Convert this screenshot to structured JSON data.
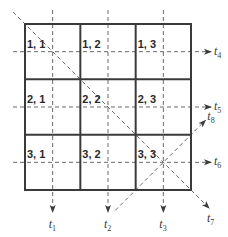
{
  "diagram": {
    "title": "",
    "grid": {
      "rows": 3,
      "cols": 3
    },
    "cells": [
      {
        "row": 1,
        "col": 1,
        "label": "1, 1"
      },
      {
        "row": 1,
        "col": 2,
        "label": "1, 2"
      },
      {
        "row": 1,
        "col": 3,
        "label": "1, 3"
      },
      {
        "row": 2,
        "col": 1,
        "label": "2, 1"
      },
      {
        "row": 2,
        "col": 2,
        "label": "2, 2"
      },
      {
        "row": 2,
        "col": 3,
        "label": "2, 3"
      },
      {
        "row": 3,
        "col": 1,
        "label": "3, 1"
      },
      {
        "row": 3,
        "col": 2,
        "label": "3, 2"
      },
      {
        "row": 3,
        "col": 3,
        "label": "3, 3"
      }
    ],
    "directions": [
      {
        "id": "t1",
        "base": "t",
        "sub": "1",
        "kind": "vertical",
        "index": 1
      },
      {
        "id": "t2",
        "base": "t",
        "sub": "2",
        "kind": "vertical",
        "index": 2
      },
      {
        "id": "t3",
        "base": "t",
        "sub": "3",
        "kind": "vertical",
        "index": 3
      },
      {
        "id": "t4",
        "base": "t",
        "sub": "4",
        "kind": "horizontal",
        "index": 1
      },
      {
        "id": "t5",
        "base": "t",
        "sub": "5",
        "kind": "horizontal",
        "index": 2
      },
      {
        "id": "t6",
        "base": "t",
        "sub": "6",
        "kind": "horizontal",
        "index": 3
      },
      {
        "id": "t7",
        "base": "t",
        "sub": "7",
        "kind": "diagonal-main"
      },
      {
        "id": "t8",
        "base": "t",
        "sub": "8",
        "kind": "diagonal-anti"
      }
    ],
    "colors": {
      "grid": "#3a3a3a",
      "dashed": "#6a6a6a",
      "text": "#2a2a2a",
      "background": "#ffffff"
    }
  }
}
